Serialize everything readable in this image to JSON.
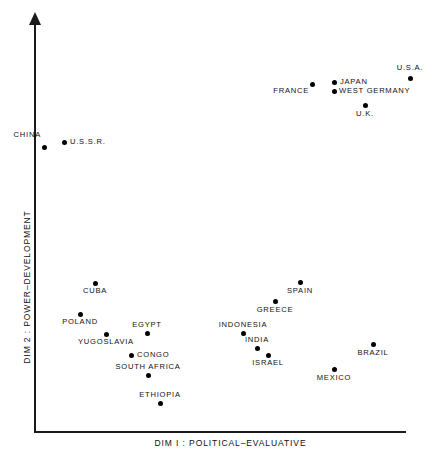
{
  "chart_data": {
    "type": "scatter",
    "title": "",
    "xlabel": "DIM I : POLITICAL–EVALUATIVE",
    "ylabel": "DIM 2 : POWER–DEVELOPMENT",
    "grid": false,
    "legend": "none",
    "xlim": [
      0,
      100
    ],
    "ylim": [
      0,
      100
    ],
    "axis_style": "two-axis-open-with-y-arrow",
    "points": [
      {
        "label": "CHINA",
        "x": 2.4,
        "y": 69.5,
        "anchor": "above-left"
      },
      {
        "label": "U.S.S.R.",
        "x": 7.8,
        "y": 70.8,
        "anchor": "right"
      },
      {
        "label": "FRANCE",
        "x": 74.7,
        "y": 85.1,
        "anchor": "below-left"
      },
      {
        "label": "JAPAN",
        "x": 80.6,
        "y": 85.6,
        "anchor": "right"
      },
      {
        "label": "WEST GERMANY",
        "x": 80.6,
        "y": 83.4,
        "anchor": "right"
      },
      {
        "label": "U.K.",
        "x": 88.9,
        "y": 80.0,
        "anchor": "below"
      },
      {
        "label": "U.S.A.",
        "x": 101.0,
        "y": 86.6,
        "anchor": "above"
      },
      {
        "label": "CUBA",
        "x": 16.4,
        "y": 36.5,
        "anchor": "below"
      },
      {
        "label": "SPAIN",
        "x": 71.5,
        "y": 36.7,
        "anchor": "below"
      },
      {
        "label": "GREECE",
        "x": 64.8,
        "y": 32.0,
        "anchor": "below"
      },
      {
        "label": "POLAND",
        "x": 12.4,
        "y": 28.8,
        "anchor": "below"
      },
      {
        "label": "EGYPT",
        "x": 30.4,
        "y": 24.1,
        "anchor": "above"
      },
      {
        "label": "INDONESIA",
        "x": 56.2,
        "y": 24.1,
        "anchor": "above"
      },
      {
        "label": "YUGOSLAVIA",
        "x": 19.4,
        "y": 23.9,
        "anchor": "below"
      },
      {
        "label": "INDIA",
        "x": 60.0,
        "y": 20.5,
        "anchor": "above"
      },
      {
        "label": "ISRAEL",
        "x": 62.9,
        "y": 18.8,
        "anchor": "below"
      },
      {
        "label": "CONGO",
        "x": 26.1,
        "y": 18.8,
        "anchor": "right"
      },
      {
        "label": "BRAZIL",
        "x": 91.1,
        "y": 21.5,
        "anchor": "below"
      },
      {
        "label": "MEXICO",
        "x": 80.6,
        "y": 15.5,
        "anchor": "below"
      },
      {
        "label": "SOUTH AFRICA",
        "x": 30.6,
        "y": 14.0,
        "anchor": "above"
      },
      {
        "label": "ETHIOPIA",
        "x": 33.9,
        "y": 7.1,
        "anchor": "above"
      }
    ],
    "pixel_points": [
      {
        "label": "CHINA",
        "px": 44,
        "py": 147,
        "lx": 41,
        "ly": 139,
        "anchor": "above-left"
      },
      {
        "label": "U.S.S.R.",
        "px": 64,
        "py": 142,
        "lx": 70,
        "ly": 142,
        "anchor": "right"
      },
      {
        "label": "FRANCE",
        "px": 312,
        "py": 84,
        "lx": 309,
        "ly": 87,
        "anchor": "below-left"
      },
      {
        "label": "JAPAN",
        "px": 334,
        "py": 82,
        "lx": 340,
        "ly": 82,
        "anchor": "right"
      },
      {
        "label": "WEST GERMANY",
        "px": 334,
        "py": 91,
        "lx": 339,
        "ly": 91,
        "anchor": "right"
      },
      {
        "label": "U.K.",
        "px": 365,
        "py": 105,
        "lx": 365,
        "ly": 110,
        "anchor": "below"
      },
      {
        "label": "U.S.A.",
        "px": 410,
        "py": 78,
        "lx": 410,
        "ly": 72,
        "anchor": "above"
      },
      {
        "label": "CUBA",
        "px": 95,
        "py": 283,
        "lx": 95,
        "ly": 287,
        "anchor": "below"
      },
      {
        "label": "SPAIN",
        "px": 300,
        "py": 282,
        "lx": 300,
        "ly": 287,
        "anchor": "below"
      },
      {
        "label": "GREECE",
        "px": 275,
        "py": 301,
        "lx": 275,
        "ly": 306,
        "anchor": "below"
      },
      {
        "label": "POLAND",
        "px": 80,
        "py": 314,
        "lx": 80,
        "ly": 318,
        "anchor": "below"
      },
      {
        "label": "EGYPT",
        "px": 147,
        "py": 333,
        "lx": 147,
        "ly": 329,
        "anchor": "above"
      },
      {
        "label": "INDONESIA",
        "px": 243,
        "py": 333,
        "lx": 243,
        "ly": 329,
        "anchor": "above"
      },
      {
        "label": "YUGOSLAVIA",
        "px": 106,
        "py": 334,
        "lx": 106,
        "ly": 338,
        "anchor": "below"
      },
      {
        "label": "INDIA",
        "px": 257,
        "py": 348,
        "lx": 257,
        "ly": 344,
        "anchor": "above"
      },
      {
        "label": "ISRAEL",
        "px": 268,
        "py": 355,
        "lx": 268,
        "ly": 359,
        "anchor": "below"
      },
      {
        "label": "CONGO",
        "px": 131,
        "py": 355,
        "lx": 137,
        "ly": 355,
        "anchor": "right"
      },
      {
        "label": "BRAZIL",
        "px": 373,
        "py": 344,
        "lx": 373,
        "ly": 349,
        "anchor": "below"
      },
      {
        "label": "MEXICO",
        "px": 334,
        "py": 369,
        "lx": 334,
        "ly": 374,
        "anchor": "below"
      },
      {
        "label": "SOUTH AFRICA",
        "px": 148,
        "py": 375,
        "lx": 148,
        "ly": 371,
        "anchor": "above"
      },
      {
        "label": "ETHIOPIA",
        "px": 160,
        "py": 403,
        "lx": 160,
        "ly": 399,
        "anchor": "above"
      }
    ]
  },
  "colors": {
    "background": "#ffffff",
    "axis": "#1a1a1a",
    "point": "#000000",
    "text": "#111111"
  }
}
